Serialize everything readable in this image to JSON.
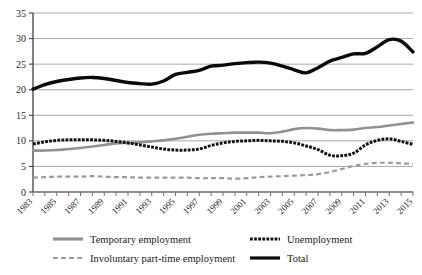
{
  "chart_data": {
    "type": "line",
    "title": "",
    "xlabel": "",
    "ylabel": "",
    "ylim": [
      0,
      35
    ],
    "ytick_values": [
      0,
      5,
      10,
      15,
      20,
      25,
      30,
      35
    ],
    "ytick_labels": [
      "0",
      "5",
      "10",
      "15",
      "20",
      "25",
      "30",
      "35"
    ],
    "grid": "horizontal",
    "legend_position": "bottom",
    "x": [
      1983,
      1984,
      1985,
      1986,
      1987,
      1988,
      1989,
      1990,
      1991,
      1992,
      1993,
      1994,
      1995,
      1996,
      1997,
      1998,
      1999,
      2000,
      2001,
      2002,
      2003,
      2004,
      2005,
      2006,
      2007,
      2008,
      2009,
      2010,
      2011,
      2012,
      2013,
      2014,
      2015
    ],
    "xtick_labels": [
      "1983",
      "1985",
      "1987",
      "1989",
      "1991",
      "1993",
      "1995",
      "1997",
      "1999",
      "2001",
      "2003",
      "2005",
      "2007",
      "2009",
      "2011",
      "2013",
      "2015"
    ],
    "xlim": [
      1983,
      2015
    ],
    "series": [
      {
        "name": "Temporary employment",
        "color": "#919191",
        "style": "solid",
        "width": 2.6,
        "values": [
          8.1,
          8.1,
          8.2,
          8.4,
          8.6,
          8.9,
          9.2,
          9.5,
          9.6,
          9.7,
          9.9,
          10.1,
          10.4,
          10.8,
          11.2,
          11.4,
          11.5,
          11.6,
          11.6,
          11.6,
          11.5,
          11.8,
          12.3,
          12.5,
          12.4,
          12.1,
          12.1,
          12.2,
          12.5,
          12.7,
          13.0,
          13.3,
          13.6
        ]
      },
      {
        "name": "Involuntary part-time employment",
        "color": "#9a9a9a",
        "style": "dashed",
        "width": 2.2,
        "values": [
          2.8,
          2.9,
          3.0,
          3.0,
          3.0,
          3.1,
          3.0,
          2.9,
          2.9,
          2.8,
          2.8,
          2.8,
          2.8,
          2.8,
          2.7,
          2.7,
          2.7,
          2.6,
          2.7,
          2.9,
          3.0,
          3.1,
          3.2,
          3.3,
          3.5,
          3.9,
          4.5,
          5.1,
          5.5,
          5.7,
          5.7,
          5.6,
          5.5
        ]
      },
      {
        "name": "Unemployment",
        "color": "#111111",
        "style": "dotted",
        "width": 3.0,
        "values": [
          9.4,
          9.8,
          10.1,
          10.2,
          10.2,
          10.2,
          10.1,
          9.9,
          9.6,
          9.2,
          8.8,
          8.4,
          8.2,
          8.2,
          8.4,
          9.1,
          9.6,
          9.9,
          10.0,
          10.1,
          10.0,
          9.9,
          9.6,
          9.0,
          8.3,
          7.2,
          7.1,
          7.6,
          9.2,
          10.1,
          10.4,
          9.9,
          9.3
        ]
      },
      {
        "name": "Total",
        "color": "#0a0a0a",
        "style": "solid",
        "width": 3.4,
        "values": [
          20.1,
          21.0,
          21.6,
          22.0,
          22.3,
          22.4,
          22.2,
          21.8,
          21.4,
          21.2,
          21.1,
          21.7,
          23.0,
          23.4,
          23.8,
          24.6,
          24.8,
          25.1,
          25.3,
          25.4,
          25.2,
          24.6,
          23.9,
          23.3,
          24.3,
          25.6,
          26.3,
          27.0,
          27.1,
          28.4,
          29.8,
          29.5,
          27.4
        ]
      }
    ],
    "legend": [
      {
        "label": "Temporary employment",
        "color": "#919191",
        "style": "solid"
      },
      {
        "label": "Unemployment",
        "color": "#111111",
        "style": "dotted"
      },
      {
        "label": "Involuntary part-time employment",
        "color": "#9a9a9a",
        "style": "dashed"
      },
      {
        "label": "Total",
        "color": "#0a0a0a",
        "style": "solid"
      }
    ]
  }
}
